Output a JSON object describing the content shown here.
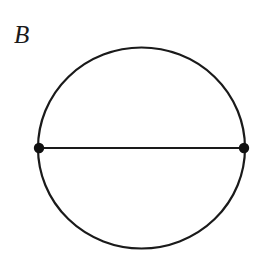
{
  "figure": {
    "label": "B",
    "caption_text": "B",
    "background_color": "#ffffff",
    "stroke_color": "#1a1a1a",
    "vertex_color": "#111111",
    "label_color": "#1a1a1a"
  },
  "chart_data": {
    "type": "diagram",
    "title": "B",
    "canvas": {
      "width": 265,
      "height": 260
    },
    "shapes": [
      {
        "name": "outer-circle",
        "kind": "ellipse",
        "cx": 141.5,
        "cy": 148,
        "rx": 103.5,
        "ry": 100.5,
        "stroke": "#1a1a1a",
        "stroke_width": 2.2,
        "fill": "none"
      },
      {
        "name": "diameter-chord",
        "kind": "line",
        "x1": 39,
        "y1": 148,
        "x2": 244,
        "y2": 148,
        "stroke": "#1a1a1a",
        "stroke_width": 2.2
      }
    ],
    "vertices": [
      {
        "name": "left-vertex",
        "cx": 39,
        "cy": 148,
        "r": 5.2,
        "fill": "#111111"
      },
      {
        "name": "right-vertex",
        "cx": 244,
        "cy": 148,
        "r": 5.2,
        "fill": "#111111"
      }
    ],
    "annotations": [
      {
        "name": "panel-label",
        "text": "B",
        "x": 16,
        "y": 44,
        "style": "italic-serif",
        "font_size": 25
      }
    ],
    "counts": {
      "vertices": 2,
      "edges": 2,
      "regions": 2
    },
    "grid": false,
    "legend": null,
    "xlabel": "",
    "ylabel": ""
  }
}
